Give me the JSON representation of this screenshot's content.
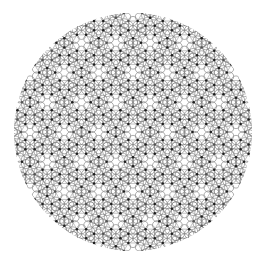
{
  "figure": {
    "canvas": {
      "width": 263,
      "height": 264,
      "background": "#ffffff"
    },
    "disk": {
      "cx": 133,
      "cy": 132,
      "r": 119
    },
    "lattice": {
      "edge": 9.2,
      "ring_radius": 4.6,
      "ring_color": "#8a8a8a",
      "ring_width": 0.7,
      "bond_color": "#9a9a9a",
      "bond_width": 0.6,
      "node_radius": 1.25,
      "node_color": "#1e1e1e",
      "node_alt_color": "#555555"
    }
  }
}
